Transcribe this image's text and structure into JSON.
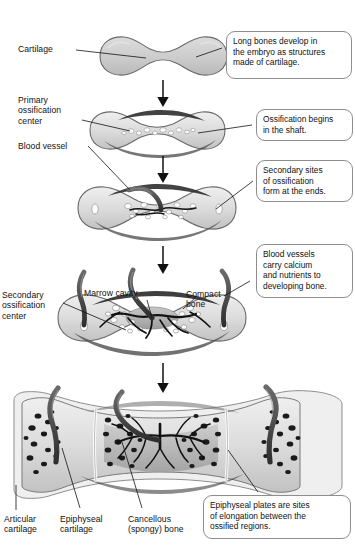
{
  "figure": {
    "background": "#ffffff",
    "ink": "#111111",
    "cartilage_fill": "#cfcfcf",
    "bone_fill": "#e9e9e9",
    "marrow_fill": "#b4b4b4",
    "vessel_fill": "#4a4a4a",
    "outline": "#5a5a5a",
    "callout_border": "#8d8d8d"
  },
  "stages": [
    {
      "id": 1,
      "name": "cartilage-model"
    },
    {
      "id": 2,
      "name": "primary-ossification"
    },
    {
      "id": 3,
      "name": "secondary-ossification"
    },
    {
      "id": 4,
      "name": "marrow-cavity-formation"
    },
    {
      "id": 5,
      "name": "mature-long-bone"
    }
  ],
  "labels": {
    "cartilage": "Cartilage",
    "primary_ossification_center": "Primary\nossification\ncenter",
    "blood_vessel": "Blood vessel",
    "secondary_ossification_center": "Secondary\nossification\ncenter",
    "marrow_cavity": "Marrow cavity",
    "compact_bone": "Compact\nbone",
    "articular_cartilage": "Articular\ncartilage",
    "epiphyseal_cartilage": "Epiphyseal\ncartilage",
    "cancellous_bone": "Cancellous\n(spongy) bone"
  },
  "callouts": {
    "one": "Long bones develop in\nthe embryo as structures\nmade of cartilage.",
    "two": "Ossification begins\nin the shaft.",
    "three": "Secondary sites\nof ossification\nform at the ends.",
    "four": "Blood vessels\ncarry calcium\nand nutrients to\ndeveloping bone.",
    "five": "Epiphyseal plates are sites\nof elongation between the\nossified regions."
  }
}
